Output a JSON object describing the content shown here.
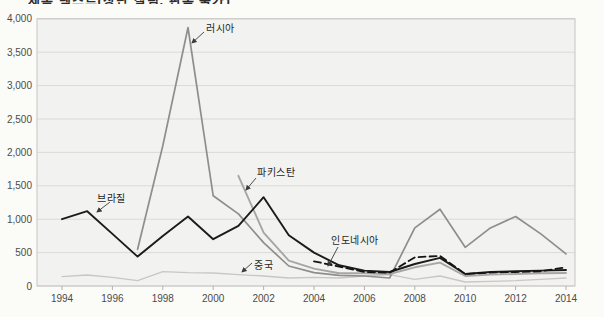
{
  "figure": {
    "clipped_title_fragment": "제목 텍스트(상단 잘림, 판독 불가)",
    "background_color": "#fbfbf8",
    "plot_fill": "#f2f2f0",
    "grid_color": "#dcdad6",
    "border_color": "#c7c5c1",
    "tick_color": "#b3b1ad",
    "axis_text_color": "#4b4b49",
    "annotation_arrow_color": "#3a3a38"
  },
  "chart_data": {
    "type": "line",
    "x": [
      1994,
      1995,
      1996,
      1997,
      1998,
      1999,
      2000,
      2001,
      2002,
      2003,
      2004,
      2005,
      2006,
      2007,
      2008,
      2009,
      2010,
      2011,
      2012,
      2013,
      2014
    ],
    "x_tick_labels": [
      "1994",
      "1996",
      "1998",
      "2000",
      "2002",
      "2004",
      "2006",
      "2008",
      "2010",
      "2012",
      "2014"
    ],
    "y_ticks": [
      0,
      500,
      1000,
      1500,
      2000,
      2500,
      3000,
      3500,
      4000
    ],
    "y_tick_labels": [
      "0",
      "500",
      "1,000",
      "1,500",
      "2,000",
      "2,500",
      "3,000",
      "3,500",
      "4,000"
    ],
    "ylim": [
      0,
      4000
    ],
    "grid": true,
    "legend_position": "inline-annotations",
    "series": [
      {
        "name": "중국",
        "color": "#c9c7c5",
        "dash": null,
        "width": 1.3,
        "values": [
          140,
          165,
          130,
          80,
          215,
          200,
          195,
          170,
          150,
          120,
          130,
          120,
          150,
          170,
          100,
          150,
          60,
          70,
          80,
          100,
          120
        ]
      },
      {
        "name": "러시아",
        "color": "#8e8e8c",
        "dash": null,
        "width": 1.7,
        "values": [
          null,
          null,
          null,
          550,
          2100,
          3870,
          1350,
          1080,
          650,
          300,
          200,
          160,
          150,
          120,
          870,
          1150,
          580,
          870,
          1040,
          780,
          480
        ]
      },
      {
        "name": "파키스탄",
        "color": "#a8a6a4",
        "dash": null,
        "width": 1.9,
        "values": [
          null,
          null,
          null,
          null,
          null,
          null,
          null,
          1650,
          800,
          380,
          260,
          190,
          190,
          180,
          280,
          350,
          150,
          170,
          180,
          190,
          195
        ]
      },
      {
        "name": "브라질",
        "color": "#1b1b1b",
        "dash": null,
        "width": 1.9,
        "values": [
          1000,
          1120,
          780,
          440,
          750,
          1040,
          700,
          900,
          1330,
          760,
          500,
          310,
          230,
          210,
          330,
          420,
          180,
          210,
          220,
          230,
          240
        ]
      },
      {
        "name": "인도네시아",
        "color": "#141414",
        "dash": "7 4",
        "width": 1.8,
        "values": [
          null,
          null,
          null,
          null,
          null,
          null,
          null,
          null,
          null,
          null,
          370,
          290,
          210,
          200,
          430,
          450,
          180,
          200,
          210,
          220,
          280
        ]
      }
    ],
    "annotations": [
      {
        "id": "russia-label",
        "label": "러시아",
        "x": 206,
        "y": 20,
        "arrow": {
          "x1": 204,
          "y1": 32,
          "x2": 192,
          "y2": 43
        }
      },
      {
        "id": "brazil-label",
        "label": "브라질",
        "x": 97,
        "y": 190,
        "arrow": {
          "x1": 110,
          "y1": 202,
          "x2": 97,
          "y2": 212
        }
      },
      {
        "id": "pakistan-label",
        "label": "파키스탄",
        "x": 257,
        "y": 164,
        "arrow": {
          "x1": 256,
          "y1": 178,
          "x2": 246,
          "y2": 190
        }
      },
      {
        "id": "indonesia-label",
        "label": "인도네시아",
        "x": 331,
        "y": 232,
        "arrow": {
          "x1": 338,
          "y1": 247,
          "x2": 328,
          "y2": 266
        }
      },
      {
        "id": "china-label",
        "label": "중국",
        "x": 254,
        "y": 257,
        "arrow": {
          "x1": 252,
          "y1": 263,
          "x2": 242,
          "y2": 272
        }
      }
    ]
  }
}
